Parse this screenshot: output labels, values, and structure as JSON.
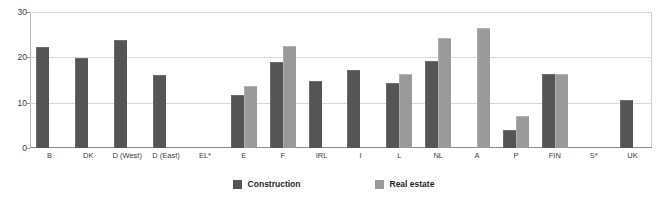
{
  "chart_data": {
    "type": "bar",
    "title": "",
    "subtitle": "",
    "xlabel": "",
    "ylabel": "",
    "ylim": [
      0,
      30
    ],
    "yticks": [
      0,
      10,
      20,
      30
    ],
    "grid": true,
    "legend_position": "bottom-center",
    "categories": [
      "B",
      "DK",
      "D (West)",
      "D (East)",
      "EL*",
      "E",
      "F",
      "IRL",
      "I",
      "L",
      "NL",
      "A",
      "P",
      "FIN",
      "S*",
      "UK"
    ],
    "series": [
      {
        "name": "Construction",
        "color": "#555555",
        "values": [
          22.3,
          19.8,
          23.8,
          16.0,
          null,
          11.8,
          19.0,
          14.8,
          17.3,
          14.3,
          19.2,
          null,
          4.0,
          16.4,
          null,
          10.5
        ]
      },
      {
        "name": "Real estate",
        "color": "#9a9a9a",
        "values": [
          null,
          null,
          null,
          null,
          null,
          13.6,
          22.5,
          null,
          null,
          16.3,
          24.3,
          26.5,
          7.0,
          16.4,
          null,
          null
        ]
      }
    ]
  },
  "legend": {
    "items": [
      {
        "label": "Construction",
        "color": "#555555",
        "swatch_name": "legend-swatch-construction"
      },
      {
        "label": "Real estate",
        "color": "#9a9a9a",
        "swatch_name": "legend-swatch-real-estate"
      }
    ]
  },
  "axis": {
    "y_tick_labels": [
      "30",
      "20",
      "10",
      "0"
    ]
  }
}
